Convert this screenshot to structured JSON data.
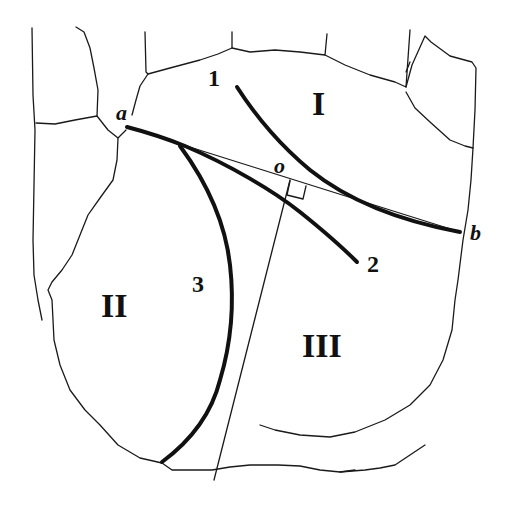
{
  "diagram": {
    "type": "palm-line-schematic",
    "points": {
      "a": "a",
      "b": "b",
      "o": "o"
    },
    "lines": {
      "line1": "1",
      "line2": "2",
      "line3": "3"
    },
    "regions": {
      "region1": "I",
      "region2": "II",
      "region3": "III"
    },
    "annotations": {
      "segment_ab": "thin straight line from a to b",
      "perpendicular": "thin line from bottom of palm perpendicular to ab at o",
      "right_angle_marker": "right-angle square at foot of perpendicular"
    }
  }
}
